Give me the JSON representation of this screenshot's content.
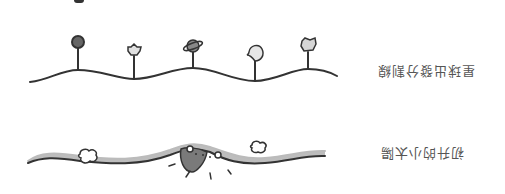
{
  "dividers": [
    {
      "id": "planet-divider",
      "label": "星球出發分割線",
      "label_rotation_deg": 180,
      "items": [
        {
          "icon": "planet-circle-icon",
          "fill": "#666666"
        },
        {
          "icon": "star-icon",
          "fill": "#e0e0e0"
        },
        {
          "icon": "saturn-icon",
          "fill": "#888888"
        },
        {
          "icon": "crescent-moon-icon",
          "fill": "#e6e6e6"
        },
        {
          "icon": "star-icon",
          "fill": "#d6d6d6"
        }
      ],
      "stroke": "#333333"
    },
    {
      "id": "rising-sun-divider",
      "label": "初升的小太陽",
      "label_rotation_deg": 180,
      "band_color": "#bdbdbd",
      "sun_color": "#7a7a7a",
      "items": [
        {
          "icon": "cloud-icon"
        },
        {
          "icon": "sun-icon"
        },
        {
          "icon": "cloud-icon"
        }
      ],
      "stroke": "#333333"
    }
  ]
}
